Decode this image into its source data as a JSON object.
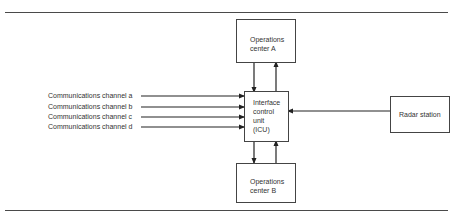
{
  "diagram": {
    "nodes": {
      "ops_a": {
        "line1": "Operations",
        "line2": "center A"
      },
      "ops_b": {
        "line1": "Operations",
        "line2": "center B"
      },
      "icu": {
        "line1": "Interface",
        "line2": "control",
        "line3": "unit",
        "line4": "(ICU)"
      },
      "radar": {
        "label": "Radar station"
      }
    },
    "channels": [
      {
        "label": "Communications channel a"
      },
      {
        "label": "Communications channel b"
      },
      {
        "label": "Communications channel c"
      },
      {
        "label": "Communications channel d"
      }
    ],
    "edges": [
      {
        "from": "Communications channel a",
        "to": "Interface control unit (ICU)"
      },
      {
        "from": "Communications channel b",
        "to": "Interface control unit (ICU)"
      },
      {
        "from": "Communications channel c",
        "to": "Interface control unit (ICU)"
      },
      {
        "from": "Communications channel d",
        "to": "Interface control unit (ICU)"
      },
      {
        "from": "Radar station",
        "to": "Interface control unit (ICU)"
      },
      {
        "from": "Operations center A",
        "to": "Interface control unit (ICU)"
      },
      {
        "from": "Interface control unit (ICU)",
        "to": "Operations center A"
      },
      {
        "from": "Operations center B",
        "to": "Interface control unit (ICU)"
      },
      {
        "from": "Interface control unit (ICU)",
        "to": "Operations center B"
      }
    ]
  }
}
